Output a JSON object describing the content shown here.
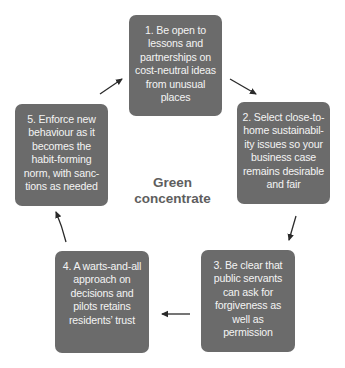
{
  "diagram": {
    "type": "cycle",
    "center_title": [
      "Green",
      "concentrate"
    ],
    "colors": {
      "box_fill": "#6b6b6b",
      "box_text": "#f4f4f4",
      "center_text": "#5e5e5e",
      "arrow": "#2a2a2a",
      "background": "#ffffff"
    },
    "steps": [
      {
        "number": 1,
        "lines": [
          "1. Be open to",
          "lessons and",
          "partnerships on",
          "cost-neutral ideas",
          "from unusual",
          "places"
        ]
      },
      {
        "number": 2,
        "lines": [
          "2. Select close-to-",
          "home sustainabil-",
          "ity issues so your",
          "business case",
          "remains desirable",
          "and fair"
        ]
      },
      {
        "number": 3,
        "lines": [
          "3. Be clear that",
          "public servants",
          "can ask for",
          "forgiveness as",
          "well as",
          "permission"
        ]
      },
      {
        "number": 4,
        "lines": [
          "4. A warts-and-all",
          "approach on",
          "decisions and",
          "pilots retains",
          "residents’ trust"
        ]
      },
      {
        "number": 5,
        "lines": [
          "5. Enforce new",
          "behaviour as it",
          "becomes the",
          "habit-forming",
          "norm, with sanc-",
          "tions as needed"
        ]
      }
    ],
    "arrows": [
      {
        "from": 1,
        "to": 2,
        "icon": "arrow-down-right-icon"
      },
      {
        "from": 2,
        "to": 3,
        "icon": "arrow-down-icon"
      },
      {
        "from": 3,
        "to": 4,
        "icon": "arrow-left-icon"
      },
      {
        "from": 4,
        "to": 5,
        "icon": "arrow-up-icon"
      },
      {
        "from": 5,
        "to": 1,
        "icon": "arrow-up-right-icon"
      }
    ]
  }
}
